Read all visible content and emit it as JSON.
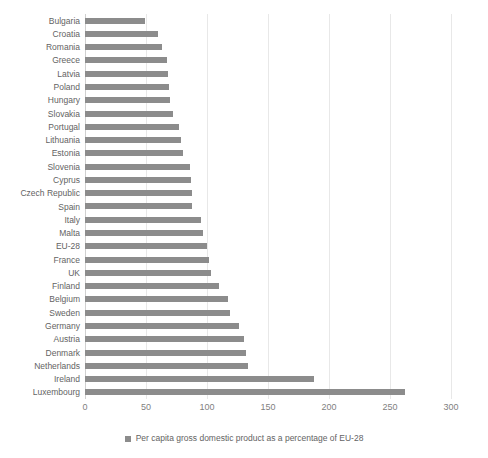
{
  "chart_data": {
    "type": "bar",
    "orientation": "horizontal",
    "title": "",
    "subtitle": "",
    "xlabel": "",
    "ylabel": "",
    "xlim": [
      0,
      300
    ],
    "xticks": [
      "0",
      "50",
      "100",
      "150",
      "200",
      "250",
      "300"
    ],
    "xtick_values": [
      0,
      50,
      100,
      150,
      200,
      250,
      300
    ],
    "grid": true,
    "grid_axis": "x",
    "legend_position": "bottom",
    "legend": [
      "Per capita gross domestic product as a percentage of EU-28"
    ],
    "series_name": "Per capita gross domestic product as a percentage of EU-28",
    "bar_color": "#8c8c8c",
    "categories": [
      "Bulgaria",
      "Croatia",
      "Romania",
      "Greece",
      "Latvia",
      "Poland",
      "Hungary",
      "Slovakia",
      "Portugal",
      "Lithuania",
      "Estonia",
      "Slovenia",
      "Cyprus",
      "Czech Republic",
      "Spain",
      "Italy",
      "Malta",
      "EU-28",
      "France",
      "UK",
      "Finland",
      "Belgium",
      "Sweden",
      "Germany",
      "Austria",
      "Denmark",
      "Netherlands",
      "Ireland",
      "Luxembourg"
    ],
    "values": [
      49,
      60,
      63,
      67,
      68,
      69,
      70,
      72,
      77,
      79,
      80,
      86,
      87,
      88,
      88,
      95,
      97,
      100,
      102,
      103,
      110,
      117,
      119,
      126,
      130,
      132,
      134,
      188,
      262
    ]
  },
  "colors": {
    "bar": "#8c8c8c",
    "gridline": "#e8e8e8",
    "axis": "#d0d0d0",
    "label_text": "#636363",
    "tick_text": "#7f7f7f",
    "background": "#ffffff"
  }
}
